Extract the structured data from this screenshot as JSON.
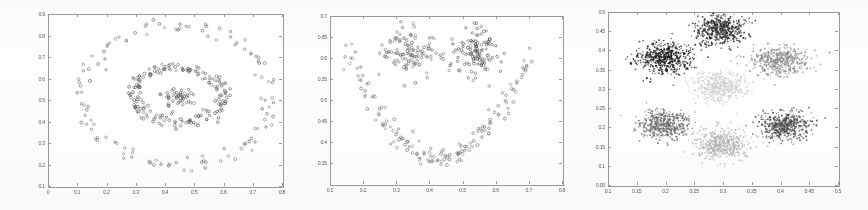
{
  "figure": {
    "title": "",
    "background": "#fdfdfd",
    "axis_color": "#9a9a9a",
    "panel_count": 3
  },
  "chart_data": [
    {
      "type": "scatter",
      "title": "",
      "xlabel": "",
      "ylabel": "",
      "panel_index": 1,
      "description": "Three concentric ring clusters: sparse outer ring, dense inner ring, small central blob",
      "xlim": [
        0.0,
        0.8
      ],
      "ylim": [
        0.1,
        0.9
      ],
      "xticks": [
        "0",
        "0.1",
        "0.2",
        "0.3",
        "0.4",
        "0.5",
        "0.6",
        "0.7",
        "0.8"
      ],
      "xtick_values": [
        0,
        0.1,
        0.2,
        0.3,
        0.4,
        0.5,
        0.6,
        0.7,
        0.8
      ],
      "yticks": [
        "0.1",
        "0.2",
        "0.3",
        "0.4",
        "0.5",
        "0.6",
        "0.7",
        "0.8",
        "0.9"
      ],
      "ytick_values": [
        0.1,
        0.2,
        0.3,
        0.4,
        0.5,
        0.6,
        0.7,
        0.8,
        0.9
      ],
      "grid": false,
      "legend": "none",
      "marker": "open-circle",
      "series": [
        {
          "name": "outer-ring",
          "color": "#555555",
          "shape": "ring",
          "center": [
            0.44,
            0.52
          ],
          "radius_x": 0.325,
          "radius_y": 0.325,
          "jitter": 0.022,
          "n_points": 120
        },
        {
          "name": "inner-ring",
          "color": "#4a4a4a",
          "shape": "ring",
          "center": [
            0.445,
            0.525
          ],
          "radius_x": 0.155,
          "radius_y": 0.125,
          "jitter": 0.014,
          "n_points": 180
        },
        {
          "name": "center-blob",
          "color": "#4a4a4a",
          "shape": "blob",
          "center": [
            0.445,
            0.515
          ],
          "radius_x": 0.028,
          "radius_y": 0.022,
          "jitter": 0.02,
          "n_points": 45
        }
      ]
    },
    {
      "type": "scatter",
      "title": "",
      "xlabel": "",
      "ylabel": "",
      "panel_index": 2,
      "description": "Smiley-face shaped data: two eye blobs above a parabolic smile arc",
      "xlim": [
        0.1,
        0.8
      ],
      "ylim": [
        0.3,
        0.7
      ],
      "xticks": [
        "0.1",
        "0.2",
        "0.3",
        "0.4",
        "0.5",
        "0.6",
        "0.7",
        "0.8"
      ],
      "xtick_values": [
        0.1,
        0.2,
        0.3,
        0.4,
        0.5,
        0.6,
        0.7,
        0.8
      ],
      "yticks": [
        "0.35",
        "0.4",
        "0.45",
        "0.5",
        "0.55",
        "0.6",
        "0.65",
        "0.7"
      ],
      "ytick_values": [
        0.35,
        0.4,
        0.45,
        0.5,
        0.55,
        0.6,
        0.65,
        0.7
      ],
      "grid": false,
      "legend": "none",
      "marker": "open-circle",
      "series": [
        {
          "name": "left-eye",
          "color": "#555555",
          "shape": "blob",
          "center": [
            0.335,
            0.615
          ],
          "radius_x": 0.042,
          "radius_y": 0.028,
          "jitter": 0.03,
          "n_points": 110
        },
        {
          "name": "right-eye",
          "color": "#3f3f3f",
          "shape": "blob",
          "center": [
            0.545,
            0.612
          ],
          "radius_x": 0.035,
          "radius_y": 0.028,
          "jitter": 0.028,
          "n_points": 110
        },
        {
          "name": "smile-arc",
          "color": "#606060",
          "shape": "parabola",
          "x_start": 0.148,
          "x_end": 0.705,
          "vertex": [
            0.43,
            0.362
          ],
          "curvature": 3.35,
          "jitter": 0.012,
          "n_points": 150
        }
      ]
    },
    {
      "type": "scatter",
      "title": "",
      "xlabel": "",
      "ylabel": "",
      "panel_index": 3,
      "description": "Six dense Gaussian clusters in two rows of three, each rendered in a different gray level",
      "xlim": [
        0.1,
        0.5
      ],
      "ylim": [
        0.05,
        0.5
      ],
      "xticks": [
        "0.1",
        "0.15",
        "0.2",
        "0.25",
        "0.3",
        "0.35",
        "0.4",
        "0.45",
        "0.5"
      ],
      "xtick_values": [
        0.1,
        0.15,
        0.2,
        0.25,
        0.3,
        0.35,
        0.4,
        0.45,
        0.5
      ],
      "yticks": [
        "0.05",
        "0.1",
        "0.15",
        "0.2",
        "0.25",
        "0.3",
        "0.35",
        "0.4",
        "0.45",
        "0.5"
      ],
      "ytick_values": [
        0.05,
        0.1,
        0.15,
        0.2,
        0.25,
        0.3,
        0.35,
        0.4,
        0.45,
        0.5
      ],
      "grid": false,
      "legend": "none",
      "marker": "dot",
      "series": [
        {
          "name": "cluster-upper-left",
          "color": "#1c1c1c",
          "shape": "gaussian",
          "center": [
            0.198,
            0.381
          ],
          "sigma_x": 0.0235,
          "sigma_y": 0.0195,
          "n_points": 520
        },
        {
          "name": "cluster-upper-mid",
          "color": "#303030",
          "shape": "gaussian",
          "center": [
            0.296,
            0.455
          ],
          "sigma_x": 0.0215,
          "sigma_y": 0.0185,
          "n_points": 500
        },
        {
          "name": "cluster-upper-right",
          "color": "#8e8e8e",
          "shape": "gaussian",
          "center": [
            0.398,
            0.372
          ],
          "sigma_x": 0.0235,
          "sigma_y": 0.0185,
          "n_points": 480
        },
        {
          "name": "cluster-center-faint",
          "color": "#cfcfcf",
          "shape": "gaussian",
          "center": [
            0.297,
            0.305
          ],
          "sigma_x": 0.0225,
          "sigma_y": 0.0195,
          "n_points": 460
        },
        {
          "name": "cluster-lower-left",
          "color": "#6d6d6d",
          "shape": "gaussian",
          "center": [
            0.199,
            0.207
          ],
          "sigma_x": 0.0225,
          "sigma_y": 0.0185,
          "n_points": 470
        },
        {
          "name": "cluster-lower-mid",
          "color": "#b5b5b5",
          "shape": "gaussian",
          "center": [
            0.299,
            0.155
          ],
          "sigma_x": 0.0225,
          "sigma_y": 0.0185,
          "n_points": 470
        },
        {
          "name": "cluster-lower-right",
          "color": "#4f4f4f",
          "shape": "gaussian",
          "center": [
            0.405,
            0.203
          ],
          "sigma_x": 0.0225,
          "sigma_y": 0.0185,
          "n_points": 480
        }
      ]
    }
  ],
  "panels": [
    {
      "name": "panel-1",
      "frame": {
        "left": 48,
        "top": 14,
        "width": 234,
        "height": 172
      }
    },
    {
      "name": "panel-2",
      "frame": {
        "left": 330,
        "top": 16,
        "width": 232,
        "height": 168
      }
    },
    {
      "name": "panel-3",
      "frame": {
        "left": 608,
        "top": 12,
        "width": 230,
        "height": 173
      }
    }
  ]
}
